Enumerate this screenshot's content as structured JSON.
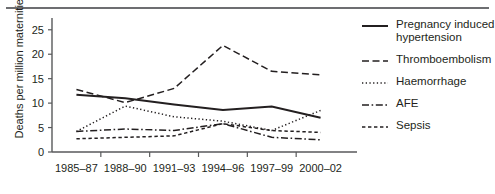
{
  "chart_data": {
    "type": "line",
    "title": "",
    "xlabel": "",
    "ylabel": "Deaths per million maternities",
    "categories": [
      "1985–87",
      "1988–90",
      "1991–93",
      "1994–96",
      "1997–99",
      "2000–02"
    ],
    "ylim": [
      0,
      27
    ],
    "yticks": [
      0,
      5,
      10,
      15,
      20,
      25
    ],
    "ytick_labels": [
      "0",
      "5",
      "10",
      "15",
      "20",
      "25"
    ],
    "grid": false,
    "legend_position": "right",
    "series": [
      {
        "name": "Pregnancy induced hypertension",
        "style": "solid",
        "color": "#231f20",
        "values": [
          11.7,
          11.0,
          9.7,
          8.6,
          9.3,
          7.0
        ]
      },
      {
        "name": "Thromboembolism",
        "style": "dashed",
        "color": "#231f20",
        "values": [
          12.8,
          10.1,
          13.0,
          21.8,
          16.5,
          15.8
        ]
      },
      {
        "name": "Haemorrhage",
        "style": "dotted",
        "color": "#231f20",
        "values": [
          4.2,
          9.4,
          7.2,
          6.3,
          4.4,
          8.5
        ]
      },
      {
        "name": "AFE",
        "style": "dash-dot",
        "color": "#231f20",
        "values": [
          4.2,
          4.7,
          4.4,
          5.8,
          3.0,
          2.5
        ]
      },
      {
        "name": "Sepsis",
        "style": "short-dash",
        "color": "#231f20",
        "values": [
          2.7,
          3.0,
          3.3,
          5.8,
          4.4,
          4.0
        ]
      }
    ]
  },
  "legend": {
    "items": [
      {
        "label": "Pregnancy induced hypertension",
        "swatch": "solid-line-icon"
      },
      {
        "label": "Thromboembolism",
        "swatch": "dashed-line-icon"
      },
      {
        "label": "Haemorrhage",
        "swatch": "dotted-line-icon"
      },
      {
        "label": "AFE",
        "swatch": "dash-dot-line-icon"
      },
      {
        "label": "Sepsis",
        "swatch": "short-dash-line-icon"
      }
    ]
  }
}
